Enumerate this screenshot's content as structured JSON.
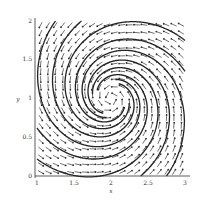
{
  "chart_data": {
    "type": "vector-field",
    "title": "",
    "xlabel": "x",
    "ylabel": "y",
    "xlim": [
      1,
      3
    ],
    "ylim": [
      0,
      2
    ],
    "xticks": [
      "1",
      "1.5",
      "2",
      "2.5",
      "3"
    ],
    "yticks": [
      "0",
      "0.5",
      "1",
      "1.5",
      "2"
    ],
    "critical_point": {
      "x": 2,
      "y": 1,
      "kind": "spiral sink"
    },
    "arrow_grid": {
      "nx": 20,
      "ny": 20
    },
    "trajectories_count": 8,
    "grid": false,
    "legend": null,
    "colors": {
      "arrows": "#333333",
      "trajectories": "#222222",
      "axes": "#333333"
    }
  }
}
